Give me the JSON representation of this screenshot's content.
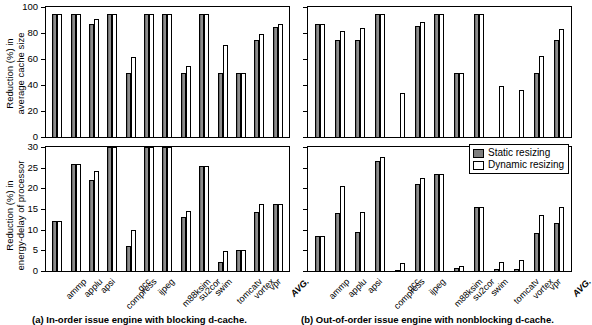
{
  "figure": {
    "series": [
      {
        "key": "static",
        "label": "Static resizing",
        "color": "#7e7e7e"
      },
      {
        "key": "dynamic",
        "label": "Dynamic resizing",
        "color": "#ffffff"
      }
    ],
    "categories": [
      "ammp",
      "applu",
      "apsi",
      "compress",
      "gcc",
      "ijpeg",
      "m88ksim",
      "su2cor",
      "swim",
      "tomcatv",
      "vortex",
      "vpr",
      "AVG."
    ],
    "captions": {
      "a": "(a) In-order issue engine with blocking d-cache.",
      "b": "(b) Out-of-order issue engine with nonblocking d-cache."
    }
  },
  "chart_data": [
    {
      "id": "a-top",
      "type": "bar",
      "panel": "a",
      "title": "",
      "ylabel": "Reduction (%) in average cache size",
      "xlabel": "",
      "ylim": [
        0,
        100
      ],
      "yticks": [
        0,
        20,
        40,
        60,
        80,
        100
      ],
      "grid": false,
      "legend": "none",
      "categories": [
        "ammp",
        "applu",
        "apsi",
        "compress",
        "gcc",
        "ijpeg",
        "m88ksim",
        "su2cor",
        "swim",
        "tomcatv",
        "vortex",
        "vpr",
        "AVG."
      ],
      "series": [
        {
          "name": "Static resizing",
          "values": [
            94.5,
            94.5,
            87.0,
            94.5,
            49.5,
            94.5,
            94.5,
            49.5,
            94.5,
            49.5,
            49.5,
            75.0,
            85.0
          ]
        },
        {
          "name": "Dynamic resizing",
          "values": [
            94.5,
            94.5,
            90.5,
            94.5,
            61.5,
            94.5,
            94.5,
            54.5,
            94.5,
            71.0,
            49.5,
            79.5,
            87.0
          ]
        }
      ]
    },
    {
      "id": "a-bottom",
      "type": "bar",
      "panel": "a",
      "title": "",
      "ylabel": "Reduction (%) in energy-delay of processor",
      "xlabel": "",
      "ylim": [
        0,
        30
      ],
      "yticks": [
        0,
        5,
        10,
        15,
        20,
        25,
        30
      ],
      "grid": false,
      "legend": "none",
      "categories": [
        "ammp",
        "applu",
        "apsi",
        "compress",
        "gcc",
        "ijpeg",
        "m88ksim",
        "su2cor",
        "swim",
        "tomcatv",
        "vortex",
        "vpr",
        "AVG."
      ],
      "series": [
        {
          "name": "Static resizing",
          "values": [
            12.0,
            26.0,
            22.1,
            30.5,
            6.1,
            30.2,
            30.0,
            13.0,
            25.5,
            2.3,
            5.0,
            14.2,
            16.2
          ]
        },
        {
          "name": "Dynamic resizing",
          "values": [
            12.0,
            25.9,
            24.2,
            30.5,
            9.9,
            30.2,
            30.0,
            14.4,
            25.4,
            4.8,
            5.1,
            16.2,
            16.3
          ]
        }
      ]
    },
    {
      "id": "b-top",
      "type": "bar",
      "panel": "b",
      "title": "",
      "ylabel": "",
      "xlabel": "",
      "ylim": [
        0,
        100
      ],
      "yticks": [
        0,
        20,
        40,
        60,
        80,
        100
      ],
      "grid": false,
      "legend": "none",
      "categories": [
        "ammp",
        "applu",
        "apsi",
        "compress",
        "gcc",
        "ijpeg",
        "m88ksim",
        "su2cor",
        "swim",
        "tomcatv",
        "vortex",
        "vpr",
        "AVG."
      ],
      "series": [
        {
          "name": "Static resizing",
          "values": [
            87.0,
            75.0,
            75.0,
            94.5,
            0.0,
            85.5,
            94.5,
            49.5,
            94.5,
            0.0,
            0.0,
            49.5,
            75.0
          ]
        },
        {
          "name": "Dynamic resizing",
          "values": [
            87.0,
            81.5,
            84.0,
            94.5,
            33.5,
            88.5,
            94.5,
            49.5,
            94.5,
            39.5,
            36.0,
            62.5,
            83.0
          ]
        }
      ]
    },
    {
      "id": "b-bottom",
      "type": "bar",
      "panel": "b",
      "title": "",
      "ylabel": "",
      "xlabel": "",
      "ylim": [
        0,
        30
      ],
      "yticks": [
        0,
        5,
        10,
        15,
        20,
        25,
        30
      ],
      "grid": false,
      "legend": "bottom-right",
      "categories": [
        "ammp",
        "applu",
        "apsi",
        "compress",
        "gcc",
        "ijpeg",
        "m88ksim",
        "su2cor",
        "swim",
        "tomcatv",
        "vortex",
        "vpr",
        "AVG."
      ],
      "series": [
        {
          "name": "Static resizing",
          "values": [
            8.4,
            14.0,
            9.5,
            26.5,
            0.3,
            21.0,
            23.5,
            0.8,
            15.5,
            0.4,
            0.4,
            9.3,
            11.5
          ]
        },
        {
          "name": "Dynamic resizing",
          "values": [
            8.4,
            20.5,
            14.3,
            27.5,
            2.0,
            22.5,
            23.5,
            1.2,
            15.5,
            2.2,
            2.6,
            13.5,
            15.5
          ]
        }
      ]
    }
  ],
  "legend": {
    "items": [
      {
        "label": "Static resizing"
      },
      {
        "label": "Dynamic resizing"
      }
    ]
  },
  "axis_titles": {
    "a_top": {
      "line1": "Reduction (%) in",
      "line2": "average cache size"
    },
    "a_bottom": {
      "line1": "Reduction (%) in",
      "line2": "energy-delay of processor"
    }
  },
  "captions": {
    "a": "(a) In-order issue engine with blocking d-cache.",
    "b": "(b) Out-of-order issue engine with nonblocking d-cache."
  }
}
